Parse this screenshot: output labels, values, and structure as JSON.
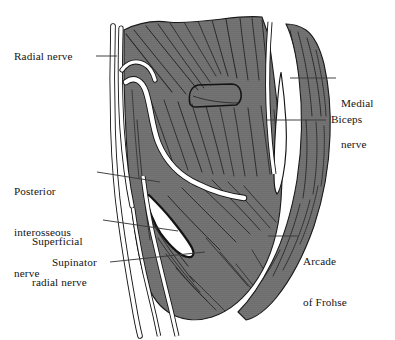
{
  "figure": {
    "background_color": "#ffffff",
    "width": 395,
    "height": 340
  },
  "colors": {
    "muscle_fill": "#6e6e6e",
    "muscle_fill_dark": "#636363",
    "striation": "#262626",
    "outline": "#1a1a1a",
    "nerve_fill": "#ffffff",
    "nerve_outline": "#111111",
    "leader_line": "#3a3a3a",
    "text": "#141414",
    "background": "#ffffff"
  },
  "labels": {
    "radial_nerve": {
      "text": "Radial nerve",
      "side": "left",
      "lines": [
        "Radial nerve"
      ]
    },
    "posterior_interosseous_nerve": {
      "text": "Posterior interosseous nerve",
      "side": "left",
      "lines": [
        "Posterior",
        "interosseous",
        "nerve"
      ]
    },
    "superficial_radial_nerve": {
      "text": "Superficial radial nerve",
      "side": "left",
      "lines": [
        "Superficial",
        "radial nerve"
      ]
    },
    "supinator": {
      "text": "Supinator",
      "side": "left",
      "lines": [
        "Supinator"
      ]
    },
    "medial_nerve": {
      "text": "Medial nerve",
      "side": "right",
      "lines": [
        "Medial",
        "nerve"
      ]
    },
    "biceps": {
      "text": "Biceps",
      "side": "right",
      "lines": [
        "Biceps"
      ]
    },
    "arcade_of_frohse": {
      "text": "Arcade of Frohse",
      "side": "right",
      "lines": [
        "Arcade",
        "of Frohse"
      ]
    }
  },
  "structures": [
    {
      "name": "radial-nerve-trunk",
      "type": "nerve"
    },
    {
      "name": "posterior-interosseous-nerve",
      "type": "nerve"
    },
    {
      "name": "superficial-radial-nerve",
      "type": "nerve"
    },
    {
      "name": "medial-nerve",
      "type": "nerve"
    },
    {
      "name": "biceps-tendon",
      "type": "tendon"
    },
    {
      "name": "supinator-muscle",
      "type": "muscle"
    },
    {
      "name": "arcade-of-frohse",
      "type": "fibrous-arch"
    }
  ]
}
